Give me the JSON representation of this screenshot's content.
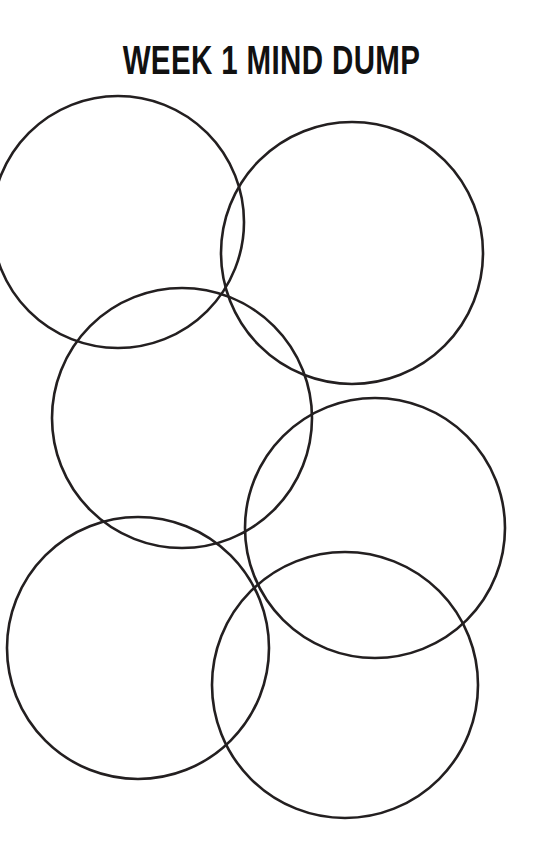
{
  "worksheet": {
    "title": "WEEK 1 MIND DUMP",
    "background_color": "#ffffff",
    "ink_color": "#231f20",
    "width": 543,
    "height": 866
  },
  "bubbles": {
    "count": 6,
    "stroke_color": "#231f20",
    "stroke_width": 2.6,
    "fill": "none",
    "items": [
      {
        "id": "bubble-1",
        "position": "top-left",
        "cx": 118,
        "cy": 222,
        "r": 126,
        "label": ""
      },
      {
        "id": "bubble-2",
        "position": "top-right",
        "cx": 352,
        "cy": 253,
        "r": 131,
        "label": ""
      },
      {
        "id": "bubble-3",
        "position": "middle-left",
        "cx": 182,
        "cy": 418,
        "r": 130,
        "label": ""
      },
      {
        "id": "bubble-4",
        "position": "middle-right",
        "cx": 375,
        "cy": 528,
        "r": 130,
        "label": ""
      },
      {
        "id": "bubble-5",
        "position": "bottom-left",
        "cx": 138,
        "cy": 648,
        "r": 131,
        "label": ""
      },
      {
        "id": "bubble-6",
        "position": "bottom-right",
        "cx": 345,
        "cy": 685,
        "r": 133,
        "label": ""
      }
    ]
  }
}
